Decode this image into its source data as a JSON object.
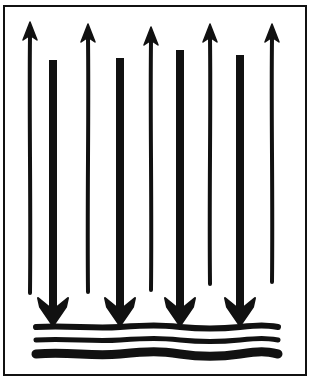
{
  "figure": {
    "colors": {
      "ink": "#111111",
      "background": "#ffffff"
    },
    "frame": {
      "x": 4,
      "y": 6,
      "width": 302,
      "height": 369
    },
    "up_arrows": [
      {
        "x": 30,
        "top": 22,
        "bottom": 293
      },
      {
        "x": 88,
        "top": 24,
        "bottom": 292
      },
      {
        "x": 151,
        "top": 27,
        "bottom": 290
      },
      {
        "x": 210,
        "top": 24,
        "bottom": 284
      },
      {
        "x": 272,
        "top": 24,
        "bottom": 282
      }
    ],
    "down_arrows": [
      {
        "x": 53,
        "top": 60,
        "tip": 326
      },
      {
        "x": 120,
        "top": 58,
        "tip": 326
      },
      {
        "x": 180,
        "top": 50,
        "tip": 326
      },
      {
        "x": 240,
        "top": 55,
        "tip": 326
      }
    ],
    "surface_lines": [
      {
        "y": 327,
        "thickness": 6
      },
      {
        "y": 340,
        "thickness": 5
      },
      {
        "y": 354,
        "thickness": 9
      }
    ]
  }
}
